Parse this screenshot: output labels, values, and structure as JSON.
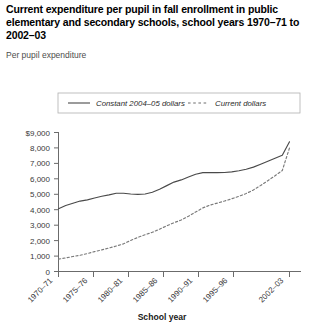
{
  "figure": {
    "title": "Current expenditure per pupil in fall enrollment in public elementary and secondary schools, school years 1970–71 to 2002–03",
    "subtitle": "Per pupil expenditure"
  },
  "chart_data": {
    "type": "line",
    "title": "Current expenditure per pupil in fall enrollment in public elementary and secondary schools, school years 1970–71 to 2002–03",
    "subtitle": "Per pupil expenditure",
    "xlabel": "School year",
    "ylabel": "",
    "grid": false,
    "legend_position": "top",
    "xlim": [
      1970,
      2002
    ],
    "ylim": [
      0,
      9000
    ],
    "ytick_labels": [
      "$9,000",
      "8,000",
      "7,000",
      "6,000",
      "5,000",
      "4,000",
      "3,000",
      "2,000",
      "1,000",
      "0"
    ],
    "ytick_values": [
      9000,
      8000,
      7000,
      6000,
      5000,
      4000,
      3000,
      2000,
      1000,
      0
    ],
    "xtick_labels": [
      "1970–71",
      "1975–76",
      "1980–81",
      "1985–86",
      "1990–91",
      "1995–96",
      "2002–03"
    ],
    "xtick_values": [
      1970,
      1975,
      1980,
      1985,
      1990,
      1995,
      2002
    ],
    "x": [
      1970,
      1971,
      1972,
      1973,
      1974,
      1975,
      1976,
      1977,
      1978,
      1979,
      1980,
      1981,
      1982,
      1983,
      1984,
      1985,
      1986,
      1987,
      1988,
      1989,
      1990,
      1991,
      1992,
      1993,
      1994,
      1995,
      1996,
      1997,
      1998,
      1999,
      2000,
      2001,
      2002
    ],
    "series": [
      {
        "name": "Constant 2004–05 dollars",
        "style": "solid",
        "color": "#4a4a4a",
        "values": [
          4060,
          4270,
          4420,
          4560,
          4640,
          4760,
          4870,
          4960,
          5070,
          5070,
          5020,
          4990,
          5020,
          5130,
          5320,
          5560,
          5790,
          5930,
          6120,
          6300,
          6400,
          6400,
          6400,
          6410,
          6450,
          6520,
          6620,
          6760,
          6950,
          7140,
          7330,
          7530,
          8400
        ]
      },
      {
        "name": "Current dollars",
        "style": "dashed",
        "color": "#8c8c8c",
        "values": [
          800,
          880,
          970,
          1050,
          1160,
          1290,
          1400,
          1520,
          1650,
          1790,
          2010,
          2210,
          2380,
          2540,
          2740,
          2960,
          3160,
          3330,
          3580,
          3850,
          4120,
          4300,
          4430,
          4560,
          4710,
          4870,
          5050,
          5280,
          5570,
          5880,
          6200,
          6540,
          8000
        ]
      }
    ]
  },
  "legend": {
    "items": [
      {
        "label": "Constant 2004–05 dollars",
        "style": "solid"
      },
      {
        "label": "Current dollars",
        "style": "dashed"
      }
    ]
  },
  "axes": {
    "x_title": "School year"
  }
}
